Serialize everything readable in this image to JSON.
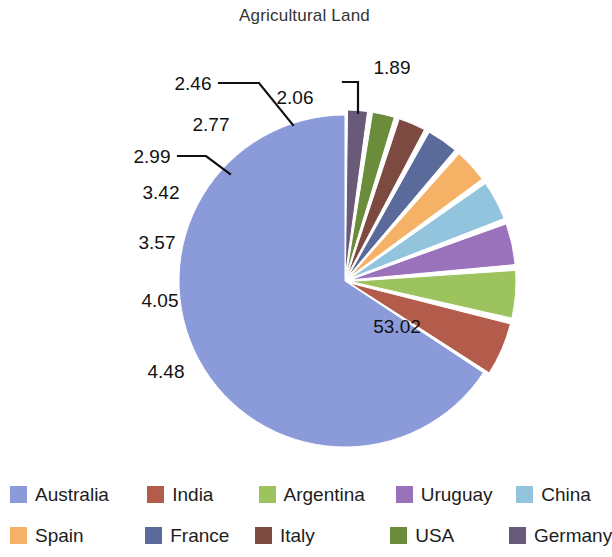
{
  "chart": {
    "title": "Agricultural Land"
  },
  "chart_data": {
    "type": "pie",
    "title": "Agricultural Land",
    "xlabel": "",
    "ylabel": "",
    "legend_position": "bottom",
    "grid": false,
    "exploded": true,
    "start_angle_deg": 90,
    "direction": "counterclockwise",
    "categories": [
      "Australia",
      "India",
      "Argentina",
      "Uruguay",
      "China",
      "Spain",
      "France",
      "Italy",
      "USA",
      "Germany"
    ],
    "values": [
      53.02,
      4.48,
      4.05,
      3.57,
      3.42,
      2.99,
      2.77,
      2.46,
      2.06,
      1.89
    ],
    "labels": [
      "53.02",
      "4.48",
      "4.05",
      "3.57",
      "3.42",
      "2.99",
      "2.77",
      "2.46",
      "2.06",
      "1.89"
    ],
    "colors": [
      "#8b9bd9",
      "#b45c4b",
      "#9cc35d",
      "#9a72bb",
      "#92c5dd",
      "#f5b266",
      "#5a6a9a",
      "#7d4a42",
      "#6b8c3a",
      "#6a5a7a"
    ],
    "slices": [
      {
        "name": "Australia",
        "value": 53.02,
        "label": "53.02",
        "color": "#8b9bd9"
      },
      {
        "name": "India",
        "value": 4.48,
        "label": "4.48",
        "color": "#b45c4b"
      },
      {
        "name": "Argentina",
        "value": 4.05,
        "label": "4.05",
        "color": "#9cc35d"
      },
      {
        "name": "Uruguay",
        "value": 3.57,
        "label": "3.57",
        "color": "#9a72bb"
      },
      {
        "name": "China",
        "value": 3.42,
        "label": "3.42",
        "color": "#92c5dd"
      },
      {
        "name": "Spain",
        "value": 2.99,
        "label": "2.99",
        "color": "#f5b266"
      },
      {
        "name": "France",
        "value": 2.77,
        "label": "2.77",
        "color": "#5a6a9a"
      },
      {
        "name": "Italy",
        "value": 2.46,
        "label": "2.46",
        "color": "#7d4a42"
      },
      {
        "name": "USA",
        "value": 2.06,
        "label": "2.06",
        "color": "#6b8c3a"
      },
      {
        "name": "Germany",
        "value": 1.89,
        "label": "1.89",
        "color": "#6a5a7a"
      }
    ],
    "total": 80.71
  },
  "labels": {
    "l0": "53.02",
    "l1": "4.48",
    "l2": "4.05",
    "l3": "3.57",
    "l4": "3.42",
    "l5": "2.99",
    "l6": "2.77",
    "l7": "2.46",
    "l8": "2.06",
    "l9": "1.89"
  },
  "legend": {
    "row1": [
      {
        "label": "Australia",
        "color": "#8b9bd9"
      },
      {
        "label": "India",
        "color": "#b45c4b"
      },
      {
        "label": "Argentina",
        "color": "#9cc35d"
      },
      {
        "label": "Uruguay",
        "color": "#9a72bb"
      },
      {
        "label": "China",
        "color": "#92c5dd"
      }
    ],
    "row2": [
      {
        "label": "Spain",
        "color": "#f5b266"
      },
      {
        "label": "France",
        "color": "#5a6a9a"
      },
      {
        "label": "Italy",
        "color": "#7d4a42"
      },
      {
        "label": "USA",
        "color": "#6b8c3a"
      },
      {
        "label": "Germany",
        "color": "#6a5a7a"
      }
    ]
  }
}
